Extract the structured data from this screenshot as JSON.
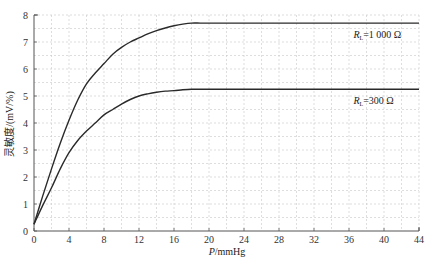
{
  "chart_data": {
    "type": "line",
    "title": "",
    "xlabel": "P/mmHg",
    "xlabel_italic": "P",
    "xlabel_unit": "/mmHg",
    "ylabel": "灵敏度/(mV/%)",
    "xlim": [
      0,
      44
    ],
    "ylim": [
      0,
      8
    ],
    "x_ticks": [
      0,
      4,
      8,
      12,
      16,
      20,
      24,
      28,
      32,
      36,
      40,
      44
    ],
    "y_ticks": [
      0,
      1,
      2,
      3,
      4,
      5,
      6,
      7,
      8
    ],
    "grid": true,
    "grid_style": "dashed minor grid (x every 2, y every 0.5)",
    "series": [
      {
        "name": "R_L=1 000 Ω",
        "label_main": "R",
        "label_sub": "L",
        "label_rest": "=1 000 Ω",
        "x": [
          0,
          1,
          2,
          3,
          4,
          5,
          6,
          7,
          8,
          9,
          10,
          11,
          12,
          13,
          14,
          15,
          16,
          17,
          18,
          19,
          20,
          24,
          28,
          32,
          36,
          40,
          44
        ],
        "values": [
          0.25,
          1.3,
          2.3,
          3.25,
          4.1,
          4.85,
          5.45,
          5.85,
          6.2,
          6.55,
          6.8,
          7.0,
          7.15,
          7.3,
          7.42,
          7.52,
          7.6,
          7.66,
          7.7,
          7.7,
          7.7,
          7.7,
          7.7,
          7.7,
          7.7,
          7.7,
          7.7
        ]
      },
      {
        "name": "R_L=300 Ω",
        "label_main": "R",
        "label_sub": "L",
        "label_rest": "=300 Ω",
        "x": [
          0,
          1,
          2,
          3,
          4,
          5,
          6,
          7,
          8,
          9,
          10,
          11,
          12,
          13,
          14,
          15,
          16,
          17,
          18,
          19,
          20,
          24,
          28,
          32,
          36,
          40,
          44
        ],
        "values": [
          0.25,
          0.95,
          1.6,
          2.3,
          2.9,
          3.35,
          3.7,
          4.0,
          4.3,
          4.5,
          4.7,
          4.87,
          5.0,
          5.08,
          5.14,
          5.18,
          5.2,
          5.23,
          5.25,
          5.25,
          5.25,
          5.25,
          5.25,
          5.25,
          5.25,
          5.25,
          5.25
        ]
      }
    ],
    "annotations": [
      {
        "text": "R_L=1 000 Ω",
        "x": 36.5,
        "y": 7.25
      },
      {
        "text": "R_L=300 Ω",
        "x": 36.5,
        "y": 4.8
      }
    ]
  },
  "colors": {
    "line": "#2a2a2a",
    "axis": "#555555",
    "grid": "#c8c8c8"
  }
}
